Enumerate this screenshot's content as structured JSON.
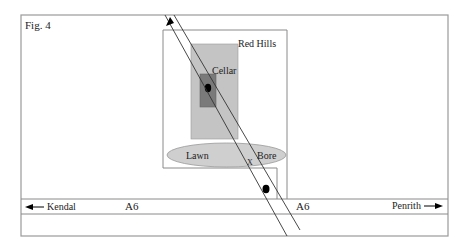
{
  "figure": {
    "label": "Fig. 4",
    "site_label": "Red Hills",
    "cellar_label": "Cellar",
    "lawn_label": "Lawn",
    "bore_label": "Bore",
    "crossing_marker": "X",
    "road": {
      "name_left": "A6",
      "name_right": "A6",
      "west_destination": "Kendal",
      "east_destination": "Penrith"
    },
    "colors": {
      "outline": "#8a8a8a",
      "outer_rect_fill": "#c4c4c4",
      "cellar_fill": "#7a7a7a",
      "lawn_fill": "#cfcfcf",
      "dot": "#000000",
      "line": "#333333"
    }
  }
}
